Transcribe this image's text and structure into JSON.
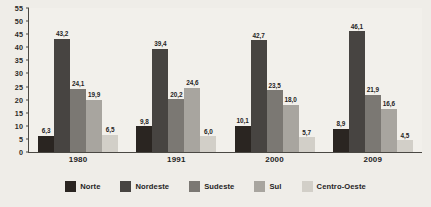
{
  "chart_data": {
    "type": "bar",
    "title": "",
    "xlabel": "",
    "ylabel": "",
    "ylim": [
      0,
      55
    ],
    "grid": false,
    "legend_position": "bottom",
    "categories": [
      "1980",
      "1991",
      "2000",
      "2009"
    ],
    "y_ticks": [
      "0",
      "5",
      "10",
      "15",
      "20",
      "25",
      "30",
      "35",
      "40",
      "45",
      "50",
      "55"
    ],
    "series": [
      {
        "name": "Norte",
        "color": "#2a2521",
        "values": [
          6.3,
          9.8,
          10.1,
          8.9
        ],
        "labels": [
          "6,3",
          "9,8",
          "10,1",
          "8,9"
        ]
      },
      {
        "name": "Nordeste",
        "color": "#474441",
        "values": [
          43.2,
          39.4,
          42.7,
          46.1
        ],
        "labels": [
          "43,2",
          "39,4",
          "42,7",
          "46,1"
        ]
      },
      {
        "name": "Sudeste",
        "color": "#7b7873",
        "values": [
          24.1,
          20.2,
          23.5,
          21.9
        ],
        "labels": [
          "24,1",
          "20,2",
          "23,5",
          "21,9"
        ]
      },
      {
        "name": "Sul",
        "color": "#a8a59f",
        "values": [
          19.9,
          24.6,
          18.0,
          16.6
        ],
        "labels": [
          "19,9",
          "24,6",
          "18,0",
          "16,6"
        ]
      },
      {
        "name": "Centro-Oeste",
        "color": "#d2cfc8",
        "values": [
          6.5,
          6.0,
          5.7,
          4.5
        ],
        "labels": [
          "6,5",
          "6,0",
          "5,7",
          "4,5"
        ]
      }
    ]
  },
  "legend": {
    "items": [
      {
        "label": "Norte",
        "color": "#2a2521"
      },
      {
        "label": "Nordeste",
        "color": "#474441"
      },
      {
        "label": "Sudeste",
        "color": "#7b7873"
      },
      {
        "label": "Sul",
        "color": "#a8a59f"
      },
      {
        "label": "Centro-Oeste",
        "color": "#d2cfc8"
      }
    ]
  }
}
